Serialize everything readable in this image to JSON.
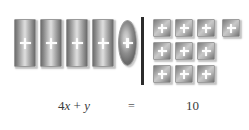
{
  "diagram": {
    "kind": "algebra-tiles-balance",
    "divider_label": "equals-bar",
    "left_side": {
      "x_tiles": {
        "count": 4,
        "glyph": "plus-icon",
        "represents": "x"
      },
      "y_tiles": {
        "count": 1,
        "glyph": "plus-icon",
        "represents": "y"
      }
    },
    "right_side": {
      "unit_tiles": {
        "total": 10,
        "glyph": "plus-icon",
        "rows": [
          4,
          3,
          3
        ]
      }
    }
  },
  "equation": {
    "coefficient": "4",
    "variable_x": "x",
    "operator": "+",
    "variable_y": "y",
    "equals": "=",
    "right": "10",
    "full": "4x + y = 10"
  },
  "colors": {
    "background": "#ffffff",
    "tile_dark": "#6e6e6e",
    "tile_light": "#dedede",
    "tile_border": "#9a9a9a",
    "plus_glyph": "#fdfdfd",
    "divider": "#2b2b2b",
    "equation_text": "#3b3b3b"
  }
}
